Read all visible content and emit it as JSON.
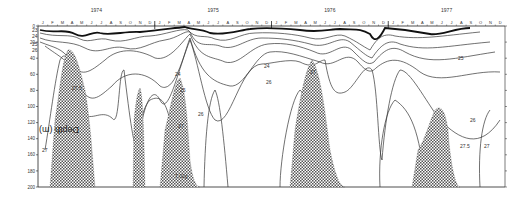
{
  "chart_data": {
    "type": "contour",
    "title": "",
    "xlabel": "",
    "ylabel": "Depth (m)",
    "ylim": [
      0,
      200
    ],
    "y_ticks": [
      0,
      20,
      40,
      60,
      80,
      100,
      120,
      140,
      160,
      180,
      200
    ],
    "years": [
      "1974",
      "1975",
      "1976",
      "1977"
    ],
    "months": [
      "J",
      "F",
      "M",
      "A",
      "M",
      "J",
      "J",
      "A",
      "S",
      "O",
      "N",
      "D"
    ],
    "contour_labels": [
      "23",
      "24",
      "25",
      "26",
      "27",
      "27.5"
    ],
    "annotations": [
      "27.5",
      "27",
      "26",
      "25",
      "24",
      "23",
      "7.02g"
    ],
    "shaded_regions": [
      {
        "label": "27.5",
        "period": "1974 Feb–Jun",
        "depth_top": 25,
        "depth_bottom": 200
      },
      {
        "label": "27.5",
        "period": "1974 Oct",
        "depth_top": 90,
        "depth_bottom": 200
      },
      {
        "label": "27.5",
        "period": "1975 Mar–Jun",
        "depth_top": 60,
        "depth_bottom": 200
      },
      {
        "label": "27.5",
        "period": "1976 Feb–Jun",
        "depth_top": 40,
        "depth_bottom": 200
      },
      {
        "label": "27.5",
        "period": "1977 Jun–Oct",
        "depth_top": 100,
        "depth_bottom": 200
      }
    ],
    "grid": false,
    "legend": "none"
  },
  "axis": {
    "depth_label": "Depth (m)",
    "arrow": "↓"
  }
}
